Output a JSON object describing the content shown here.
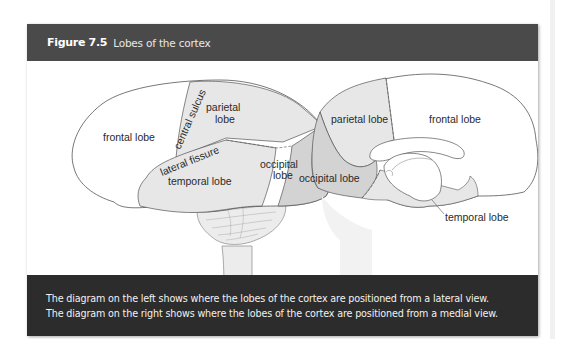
{
  "figure": {
    "label": "Figure 7.5",
    "title": "Lobes of the cortex"
  },
  "colors": {
    "header_bg": "#4a4a4a",
    "caption_bg": "#2c2c2c",
    "lobe_fill_light": "#e6e6e6",
    "lobe_fill_dark": "#d2d2d2",
    "outline": "#555555"
  },
  "lateral_view": {
    "labels": {
      "frontal": "frontal lobe",
      "central_sulcus": "central sulcus",
      "parietal_line1": "parietal",
      "parietal_line2": "lobe",
      "lateral_fissure": "lateral fissure",
      "temporal": "temporal lobe",
      "occipital_line1": "occipital",
      "occipital_line2": "lobe"
    }
  },
  "medial_view": {
    "labels": {
      "parietal": "parietal lobe",
      "frontal": "frontal lobe",
      "occipital": "occipital lobe",
      "temporal": "temporal lobe"
    }
  },
  "caption": {
    "line1": "The diagram on the left shows where the lobes of the cortex are positioned from a lateral view.",
    "line2": "The diagram on the right shows where the lobes of the cortex are positioned from a medial view."
  }
}
